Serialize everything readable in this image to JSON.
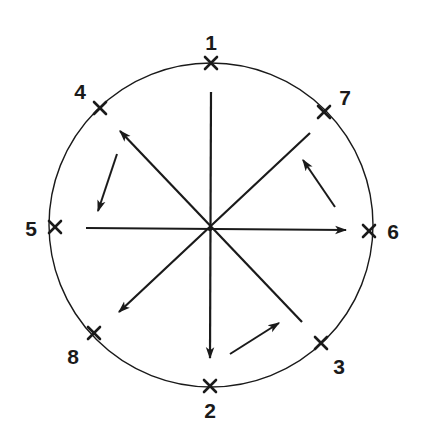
{
  "diagram": {
    "title": "",
    "stroke_color": "#1a1a1a",
    "background": "#ffffff",
    "circle": {
      "cx": 211,
      "cy": 225,
      "r": 162
    },
    "center": {
      "x": 210,
      "y": 229
    },
    "points": [
      {
        "id": 1,
        "label": "1",
        "marker": {
          "x": 211,
          "y": 63
        },
        "label_pos": {
          "x": 211,
          "y": 42
        }
      },
      {
        "id": 2,
        "label": "2",
        "marker": {
          "x": 210,
          "y": 386
        },
        "label_pos": {
          "x": 210,
          "y": 410
        }
      },
      {
        "id": 3,
        "label": "3",
        "marker": {
          "x": 321,
          "y": 343
        },
        "label_pos": {
          "x": 339,
          "y": 366
        }
      },
      {
        "id": 4,
        "label": "4",
        "marker": {
          "x": 100,
          "y": 108
        },
        "label_pos": {
          "x": 80,
          "y": 91
        }
      },
      {
        "id": 5,
        "label": "5",
        "marker": {
          "x": 55,
          "y": 227
        },
        "label_pos": {
          "x": 31,
          "y": 228
        }
      },
      {
        "id": 6,
        "label": "6",
        "marker": {
          "x": 369,
          "y": 231
        },
        "label_pos": {
          "x": 393,
          "y": 231
        }
      },
      {
        "id": 7,
        "label": "7",
        "marker": {
          "x": 324,
          "y": 112
        },
        "label_pos": {
          "x": 345,
          "y": 97
        }
      },
      {
        "id": 8,
        "label": "8",
        "marker": {
          "x": 94,
          "y": 333
        },
        "label_pos": {
          "x": 73,
          "y": 356
        }
      }
    ],
    "radial_lines": [
      {
        "name": "line-1-2",
        "from": {
          "x": 211,
          "y": 92
        },
        "to": {
          "x": 210,
          "y": 358
        },
        "arrow_at_end": true
      },
      {
        "name": "line-5-6",
        "from": {
          "x": 86,
          "y": 228
        },
        "to": {
          "x": 346,
          "y": 230
        },
        "arrow_at_end": true
      },
      {
        "name": "line-3-4",
        "from": {
          "x": 302,
          "y": 322
        },
        "to": {
          "x": 120,
          "y": 131
        },
        "arrow_at_end": true
      },
      {
        "name": "line-7-8",
        "from": {
          "x": 310,
          "y": 133
        },
        "to": {
          "x": 119,
          "y": 312
        },
        "arrow_at_end": true
      }
    ],
    "rotation_arrows": [
      {
        "name": "arrow-upper-left",
        "from": {
          "x": 117,
          "y": 154
        },
        "to": {
          "x": 98,
          "y": 211
        }
      },
      {
        "name": "arrow-upper-right",
        "from": {
          "x": 335,
          "y": 207
        },
        "to": {
          "x": 303,
          "y": 160
        }
      },
      {
        "name": "arrow-bottom",
        "from": {
          "x": 230,
          "y": 354
        },
        "to": {
          "x": 279,
          "y": 323
        }
      }
    ]
  }
}
